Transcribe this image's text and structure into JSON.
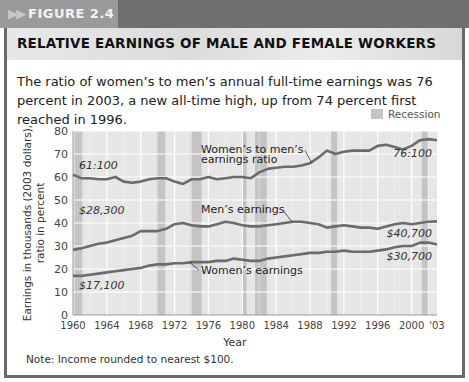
{
  "figure_label": "FIGURE 2.4",
  "title": "RELATIVE EARNINGS OF MALE AND FEMALE WORKERS",
  "description": "The ratio of women’s to men’s annual full-time earnings was 76 percent in 2003, a new all-time high, up from 74 percent first reached in 1996.",
  "note": "Note: Income rounded to nearest $100.",
  "legend": {
    "recession_label": "Recession"
  },
  "colors": {
    "line": "#6b6b6b",
    "plot_bg": "#e6e6e6",
    "recession": "#c4c4c4",
    "grid": "#ffffff"
  },
  "chart_data": {
    "type": "line",
    "title": "RELATIVE EARNINGS OF MALE AND FEMALE WORKERS",
    "xlabel": "Year",
    "ylabel": "Earnings in thousands (2003 dollars), ratio in percent",
    "xlim": [
      1960,
      2003
    ],
    "ylim": [
      0,
      80
    ],
    "yticks": [
      0,
      10,
      20,
      30,
      40,
      50,
      60,
      70,
      80
    ],
    "xtick_labels": [
      "1960",
      "1964",
      "1968",
      "1972",
      "1976",
      "1980",
      "1984",
      "1988",
      "1992",
      "1996",
      "2000",
      "'03"
    ],
    "grid": true,
    "x": [
      1960,
      1961,
      1962,
      1963,
      1964,
      1965,
      1966,
      1967,
      1968,
      1969,
      1970,
      1971,
      1972,
      1973,
      1974,
      1975,
      1976,
      1977,
      1978,
      1979,
      1980,
      1981,
      1982,
      1983,
      1984,
      1985,
      1986,
      1987,
      1988,
      1989,
      1990,
      1991,
      1992,
      1993,
      1994,
      1995,
      1996,
      1997,
      1998,
      1999,
      2000,
      2001,
      2002,
      2003
    ],
    "series": [
      {
        "name": "Women's to men's earnings ratio",
        "values": [
          61,
          59.5,
          59.5,
          59,
          59,
          60,
          58,
          57.5,
          58,
          59,
          59.5,
          59.5,
          58,
          57,
          59,
          59,
          60,
          59,
          59.5,
          60,
          60,
          59.5,
          62,
          63.5,
          64,
          64.5,
          64.5,
          65,
          66,
          68.5,
          71.5,
          70,
          71,
          71.5,
          71.5,
          71.5,
          73.5,
          74,
          73,
          72,
          73.5,
          76,
          76.5,
          76
        ],
        "start_label": "61:100",
        "end_label": "76:100"
      },
      {
        "name": "Men's earnings",
        "values": [
          28.3,
          29,
          30,
          31,
          31.5,
          32.5,
          33.5,
          34.5,
          36.5,
          36.5,
          36.5,
          37.5,
          39.5,
          40,
          39,
          38.5,
          38.5,
          39.5,
          40.5,
          40,
          39,
          38.5,
          38.5,
          39,
          39.5,
          40,
          40.5,
          40.5,
          40,
          39.5,
          38,
          38.5,
          39,
          38.5,
          38,
          38,
          37.5,
          38.5,
          39.5,
          40,
          39.5,
          40,
          40.5,
          40.7
        ],
        "start_label": "$28,300",
        "end_label": "$40,700"
      },
      {
        "name": "Women's earnings",
        "values": [
          17.1,
          17,
          17.5,
          18,
          18.5,
          19,
          19.5,
          20,
          20.5,
          21.5,
          22,
          22,
          22.5,
          22.5,
          23,
          23,
          23,
          23.5,
          23.5,
          24.5,
          24,
          23.5,
          23.5,
          24.5,
          25,
          25.5,
          26,
          26.5,
          27,
          27,
          27.5,
          27.5,
          28,
          27.5,
          27.5,
          27.5,
          28,
          28.5,
          29.5,
          30,
          30,
          31.5,
          31.5,
          30.7
        ],
        "start_label": "$17,100",
        "end_label": "$30,700"
      }
    ],
    "recessions": [
      [
        1960.2,
        1961.1
      ],
      [
        1969.9,
        1970.9
      ],
      [
        1973.9,
        1975.2
      ],
      [
        1980.0,
        1980.5
      ],
      [
        1981.5,
        1982.9
      ],
      [
        1990.5,
        1991.2
      ],
      [
        2001.2,
        2001.9
      ]
    ],
    "annotations": [
      {
        "text": "Women’s to men’s",
        "text2": "earnings ratio",
        "points_to": 1988
      },
      {
        "text": "Men’s earnings",
        "points_to": 1982
      },
      {
        "text": "Women’s earnings",
        "points_to": 1973
      }
    ],
    "legend_position": "top-right"
  }
}
